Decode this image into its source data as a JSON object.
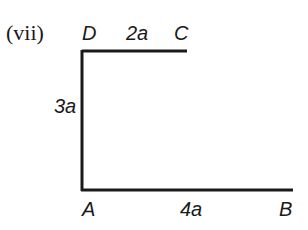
{
  "figure": {
    "number_label": "(vii)",
    "points": {
      "D": {
        "label": "D"
      },
      "C": {
        "label": "C"
      },
      "A": {
        "label": "A"
      },
      "B": {
        "label": "B"
      }
    },
    "segments": {
      "DC": {
        "length_label": "2a"
      },
      "DA": {
        "length_label": "3a"
      },
      "AB": {
        "length_label": "4a"
      }
    },
    "line_color": "#1a1a1a"
  }
}
